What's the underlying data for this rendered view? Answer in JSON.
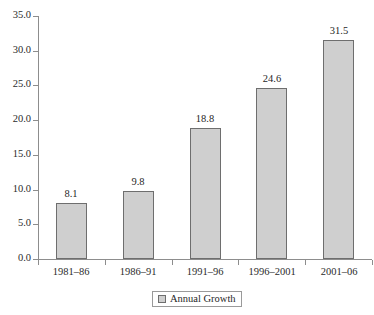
{
  "chart_data": {
    "type": "bar",
    "title": "",
    "subtitle": "",
    "xlabel": "",
    "ylabel": "",
    "categories": [
      "1981–86",
      "1986–91",
      "1991–96",
      "1996–2001",
      "2001–06"
    ],
    "values": [
      8.1,
      9.8,
      18.8,
      24.6,
      31.5
    ],
    "value_labels": [
      "8.1",
      "9.8",
      "18.8",
      "24.6",
      "31.5"
    ],
    "series": [
      {
        "name": "Annual Growth",
        "values": [
          8.1,
          9.8,
          18.8,
          24.6,
          31.5
        ]
      }
    ],
    "ylim": [
      0.0,
      35.0
    ],
    "ytick_values": [
      0.0,
      5.0,
      10.0,
      15.0,
      20.0,
      25.0,
      30.0,
      35.0
    ],
    "ytick_labels": [
      "0.0",
      "5.0",
      "10.0",
      "15.0",
      "20.0",
      "25.0",
      "30.0",
      "35.0"
    ],
    "grid": false,
    "legend_position": "bottom",
    "legend_entries": [
      "Annual Growth"
    ],
    "colors": {
      "bar_fill": "#cfcfcf",
      "bar_border": "#6e6e6e",
      "axis": "#8d8d8d",
      "text": "#1f1f1f",
      "background": "#ffffff"
    }
  },
  "legend": {
    "label": "Annual Growth",
    "swatch_name": "series-swatch"
  }
}
